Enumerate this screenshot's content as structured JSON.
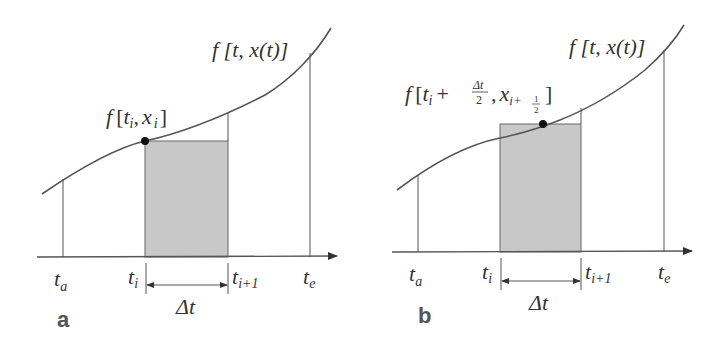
{
  "figure": {
    "panels": [
      {
        "id": "a",
        "label": "a",
        "curve_label": "f [t, x(t)]",
        "point_label": "f [t_i, x_i]",
        "point_label_parts": {
          "f": "f",
          "open": "[",
          "t": "t",
          "sub_i": "i",
          "comma": ",",
          "x": "x",
          "sub_i2": "i",
          "close": "]"
        },
        "tick_labels": {
          "t_a": {
            "base": "t",
            "sub": "a"
          },
          "t_i": {
            "base": "t",
            "sub": "i"
          },
          "t_i1": {
            "base": "t",
            "sub": "i+1"
          },
          "t_e": {
            "base": "t",
            "sub": "e"
          }
        },
        "interval_label": "Δt",
        "evaluation": "left endpoint (explicit Euler)"
      },
      {
        "id": "b",
        "label": "b",
        "curve_label": "f [t, x(t)]",
        "point_label": "f [t_i + Δt/2, x_{i+1/2}]",
        "point_label_parts": {
          "f": "f",
          "open": "[",
          "t": "t",
          "sub_i": "i",
          "plus": "+",
          "frac_num": "Δt",
          "frac_den": "2",
          "comma": ",",
          "x": "x",
          "sub_x": "i+",
          "sub_frac_num": "1",
          "sub_frac_den": "2",
          "close": "]"
        },
        "tick_labels": {
          "t_a": {
            "base": "t",
            "sub": "a"
          },
          "t_i": {
            "base": "t",
            "sub": "i"
          },
          "t_i1": {
            "base": "t",
            "sub": "i+1"
          },
          "t_e": {
            "base": "t",
            "sub": "e"
          }
        },
        "interval_label": "Δt",
        "evaluation": "midpoint"
      }
    ],
    "colors": {
      "line": "#555555",
      "fill": "#c8c8c8",
      "text": "#333333"
    }
  }
}
